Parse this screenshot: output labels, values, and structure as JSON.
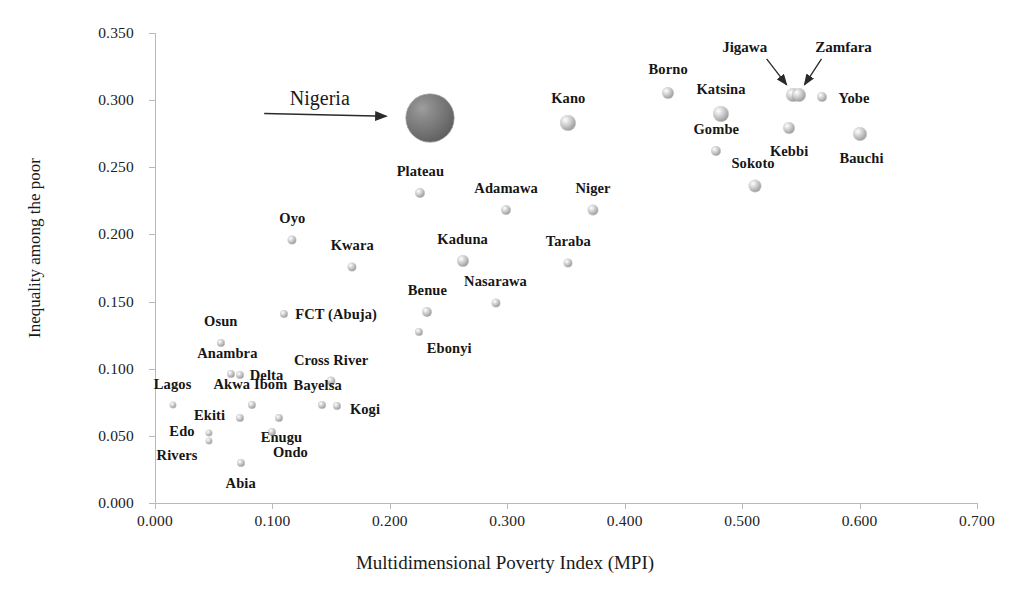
{
  "chart_data": {
    "type": "scatter",
    "title": "",
    "xlabel": "Multidimensional Poverty Index (MPI)",
    "ylabel": "Inequality among the poor",
    "xlim": [
      0.0,
      0.7
    ],
    "ylim": [
      0.0,
      0.35
    ],
    "xticks": [
      "0.000",
      "0.100",
      "0.200",
      "0.300",
      "0.400",
      "0.500",
      "0.600",
      "0.700"
    ],
    "yticks": [
      "0.000",
      "0.050",
      "0.100",
      "0.150",
      "0.200",
      "0.250",
      "0.300",
      "0.350"
    ],
    "grid": false,
    "legend": "none",
    "marker_style": "3d-sphere-bubble",
    "points": [
      {
        "name": "Nigeria",
        "x": 0.234,
        "y": 0.287,
        "r": 24,
        "highlight": true,
        "label_dx": -110,
        "label_dy": -20,
        "label_kind": "callout"
      },
      {
        "name": "Kano",
        "x": 0.352,
        "y": 0.283,
        "r": 7.5,
        "highlight": false,
        "label_dx": 0,
        "label_dy": -25,
        "label_kind": "point"
      },
      {
        "name": "Borno",
        "x": 0.437,
        "y": 0.305,
        "r": 5.5,
        "highlight": false,
        "label_dx": 0,
        "label_dy": -24,
        "label_kind": "point"
      },
      {
        "name": "Katsina",
        "x": 0.482,
        "y": 0.29,
        "r": 7.5,
        "highlight": false,
        "label_dx": 0,
        "label_dy": -25,
        "label_kind": "point"
      },
      {
        "name": "Jigawa",
        "x": 0.543,
        "y": 0.304,
        "r": 6.5,
        "highlight": false,
        "label_dx": -48,
        "label_dy": -48,
        "label_kind": "arrow"
      },
      {
        "name": "Zamfara",
        "x": 0.548,
        "y": 0.304,
        "r": 6.5,
        "highlight": false,
        "label_dx": 45,
        "label_dy": -48,
        "label_kind": "arrow"
      },
      {
        "name": "Yobe",
        "x": 0.568,
        "y": 0.302,
        "r": 4.5,
        "highlight": false,
        "label_dx": 32,
        "label_dy": 1,
        "label_kind": "point"
      },
      {
        "name": "Gombe",
        "x": 0.478,
        "y": 0.262,
        "r": 4.5,
        "highlight": false,
        "label_dx": 0,
        "label_dy": -22,
        "label_kind": "point"
      },
      {
        "name": "Kebbi",
        "x": 0.54,
        "y": 0.279,
        "r": 5.5,
        "highlight": false,
        "label_dx": 0,
        "label_dy": 23,
        "label_kind": "point"
      },
      {
        "name": "Bauchi",
        "x": 0.6,
        "y": 0.275,
        "r": 6.5,
        "highlight": false,
        "label_dx": 2,
        "label_dy": 24,
        "label_kind": "point"
      },
      {
        "name": "Sokoto",
        "x": 0.511,
        "y": 0.236,
        "r": 6,
        "highlight": false,
        "label_dx": -2,
        "label_dy": -23,
        "label_kind": "point"
      },
      {
        "name": "Plateau",
        "x": 0.226,
        "y": 0.231,
        "r": 4.5,
        "highlight": false,
        "label_dx": 0,
        "label_dy": -22,
        "label_kind": "point"
      },
      {
        "name": "Adamawa",
        "x": 0.299,
        "y": 0.218,
        "r": 4.5,
        "highlight": false,
        "label_dx": 0,
        "label_dy": -22,
        "label_kind": "point"
      },
      {
        "name": "Niger",
        "x": 0.373,
        "y": 0.218,
        "r": 5,
        "highlight": false,
        "label_dx": 0,
        "label_dy": -22,
        "label_kind": "point"
      },
      {
        "name": "Oyo",
        "x": 0.117,
        "y": 0.196,
        "r": 4,
        "highlight": false,
        "label_dx": 0,
        "label_dy": -22,
        "label_kind": "point"
      },
      {
        "name": "Kaduna",
        "x": 0.262,
        "y": 0.18,
        "r": 5.5,
        "highlight": false,
        "label_dx": 0,
        "label_dy": -22,
        "label_kind": "point"
      },
      {
        "name": "Taraba",
        "x": 0.352,
        "y": 0.179,
        "r": 4,
        "highlight": false,
        "label_dx": 0,
        "label_dy": -22,
        "label_kind": "point"
      },
      {
        "name": "Kwara",
        "x": 0.168,
        "y": 0.176,
        "r": 4,
        "highlight": false,
        "label_dx": 0,
        "label_dy": -22,
        "label_kind": "point"
      },
      {
        "name": "Nasarawa",
        "x": 0.29,
        "y": 0.149,
        "r": 4,
        "highlight": false,
        "label_dx": 0,
        "label_dy": -22,
        "label_kind": "point"
      },
      {
        "name": "Benue",
        "x": 0.232,
        "y": 0.142,
        "r": 4.5,
        "highlight": false,
        "label_dx": 0,
        "label_dy": -22,
        "label_kind": "point"
      },
      {
        "name": "FCT (Abuja)",
        "x": 0.11,
        "y": 0.141,
        "r": 3.5,
        "highlight": false,
        "label_dx": 52,
        "label_dy": 0,
        "label_kind": "point"
      },
      {
        "name": "Ebonyi",
        "x": 0.225,
        "y": 0.127,
        "r": 3.5,
        "highlight": false,
        "label_dx": 30,
        "label_dy": 16,
        "label_kind": "point"
      },
      {
        "name": "Osun",
        "x": 0.056,
        "y": 0.119,
        "r": 3.5,
        "highlight": false,
        "label_dx": 0,
        "label_dy": -22,
        "label_kind": "point"
      },
      {
        "name": "Anambra",
        "x": 0.065,
        "y": 0.096,
        "r": 3.5,
        "highlight": false,
        "label_dx": -4,
        "label_dy": -21,
        "label_kind": "point"
      },
      {
        "name": "Delta",
        "x": 0.072,
        "y": 0.095,
        "r": 3.5,
        "highlight": false,
        "label_dx": 27,
        "label_dy": 0,
        "label_kind": "point"
      },
      {
        "name": "Cross River",
        "x": 0.15,
        "y": 0.091,
        "r": 4,
        "highlight": false,
        "label_dx": 0,
        "label_dy": -21,
        "label_kind": "point"
      },
      {
        "name": "Bayelsa",
        "x": 0.142,
        "y": 0.073,
        "r": 3.5,
        "highlight": false,
        "label_dx": -4,
        "label_dy": -20,
        "label_kind": "point"
      },
      {
        "name": "Kogi",
        "x": 0.155,
        "y": 0.072,
        "r": 3.5,
        "highlight": false,
        "label_dx": 28,
        "label_dy": 3,
        "label_kind": "point"
      },
      {
        "name": "Akwa Ibom",
        "x": 0.083,
        "y": 0.073,
        "r": 3.5,
        "highlight": false,
        "label_dx": -2,
        "label_dy": -21,
        "label_kind": "point"
      },
      {
        "name": "Lagos",
        "x": 0.015,
        "y": 0.073,
        "r": 3,
        "highlight": false,
        "label_dx": 0,
        "label_dy": -21,
        "label_kind": "point"
      },
      {
        "name": "Enugu",
        "x": 0.106,
        "y": 0.063,
        "r": 3.5,
        "highlight": false,
        "label_dx": 2,
        "label_dy": 19,
        "label_kind": "point"
      },
      {
        "name": "Ekiti",
        "x": 0.072,
        "y": 0.063,
        "r": 3.5,
        "highlight": false,
        "label_dx": -30,
        "label_dy": -3,
        "label_kind": "point"
      },
      {
        "name": "Edo",
        "x": 0.046,
        "y": 0.052,
        "r": 3,
        "highlight": false,
        "label_dx": -27,
        "label_dy": -2,
        "label_kind": "point"
      },
      {
        "name": "Rivers",
        "x": 0.046,
        "y": 0.046,
        "r": 3,
        "highlight": false,
        "label_dx": -32,
        "label_dy": 14,
        "label_kind": "point"
      },
      {
        "name": "Ondo",
        "x": 0.1,
        "y": 0.053,
        "r": 3.5,
        "highlight": false,
        "label_dx": 18,
        "label_dy": 20,
        "label_kind": "point"
      },
      {
        "name": "Abia",
        "x": 0.073,
        "y": 0.03,
        "r": 3.5,
        "highlight": false,
        "label_dx": 0,
        "label_dy": 20,
        "label_kind": "point"
      }
    ],
    "annotations": [
      {
        "text": "Nigeria",
        "arrow_from_x": 0.093,
        "arrow_from_y": 0.29,
        "arrow_to_x": 0.197,
        "arrow_to_y": 0.288
      }
    ]
  },
  "axes": {
    "x_title": "Multidimensional Poverty Index (MPI)",
    "y_title": "Inequality among the poor"
  },
  "colors": {
    "background": "#ffffff",
    "axis": "#b9b9b9",
    "text": "#161616",
    "bubble_fill": "#b4b4b4",
    "bubble_highlight": "#6f6f6f"
  }
}
